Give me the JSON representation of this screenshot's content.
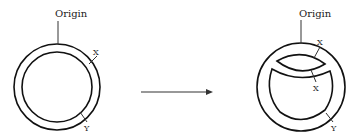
{
  "diagram": {
    "left": {
      "origin_label": "Origin",
      "mark_x_label": "X",
      "mark_y_label": "Y"
    },
    "arrow": {
      "direction": "right"
    },
    "right": {
      "origin_label": "Origin",
      "mark_x_top_label": "X",
      "mark_x_bottom_label": "X",
      "mark_y_label": "Y"
    }
  }
}
